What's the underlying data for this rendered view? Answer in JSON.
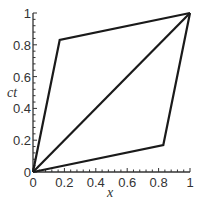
{
  "chart_data": {
    "type": "line",
    "title": "",
    "xlabel": "x",
    "ylabel": "ct",
    "xlim": [
      0,
      1
    ],
    "ylim": [
      0,
      1
    ],
    "grid": false,
    "legend": null,
    "x_ticks": [
      0,
      0.2,
      0.4,
      0.6,
      0.8,
      1
    ],
    "x_tick_labels": [
      "0",
      "0.2",
      "0.4",
      "0.6",
      "0.8",
      "1"
    ],
    "y_ticks": [
      0,
      0.2,
      0.4,
      0.6,
      0.8,
      1
    ],
    "y_tick_labels": [
      "0",
      "0.2",
      "0.4",
      "0.6",
      "0.8",
      "1"
    ],
    "series": [
      {
        "name": "upper-worldline",
        "x": [
          0,
          0.17,
          1
        ],
        "y": [
          0,
          0.83,
          1
        ]
      },
      {
        "name": "diagonal",
        "x": [
          0,
          1
        ],
        "y": [
          0,
          1
        ]
      },
      {
        "name": "lower-worldline",
        "x": [
          0,
          0.83,
          1
        ],
        "y": [
          0,
          0.17,
          1
        ]
      }
    ],
    "line_color": "#1a1a1a"
  }
}
